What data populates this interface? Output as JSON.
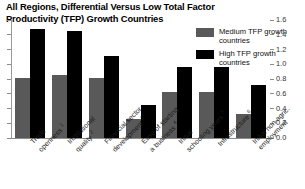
{
  "chart": {
    "title": "All Regions, Differential Versus Low Total Factor Productivity (TFP) Growth Countries"
  },
  "legend": {
    "position": "top-right",
    "items": [
      {
        "label": "Medium TFP growth countries",
        "color": "#595959",
        "name": "medium-tfp"
      },
      {
        "label": "High TFP growth countries",
        "color": "#000000",
        "name": "high-tfp"
      }
    ]
  },
  "axis": {
    "right_ticks": [
      "1.6",
      "1.4",
      "1.2",
      "1.0",
      "0.8",
      "0.6",
      "0.4",
      "0.2",
      "0.0"
    ],
    "values": [
      1.6,
      1.4,
      1.2,
      1.0,
      0.8,
      0.6,
      0.4,
      0.2,
      0.0
    ]
  },
  "categories": [
    {
      "line1": "Trade",
      "line2": "openness",
      "note": "1"
    },
    {
      "line1": "Institutional",
      "line2": "quality",
      "note": "2"
    },
    {
      "line1": "Financial sector",
      "line2": "development",
      "note": "3"
    },
    {
      "line1": "Ease of starting",
      "line2": "a business",
      "note": "4"
    },
    {
      "line1": "Initial",
      "line2": "schooling years",
      "note": "5"
    },
    {
      "line1": "Infrastructure",
      "line2": "",
      "note": "6"
    },
    {
      "line1": "Initial non-agric.",
      "line2": "employment",
      "note": ""
    }
  ],
  "chart_data": {
    "type": "bar",
    "title": "All Regions, Differential Versus Low Total Factor Productivity (TFP) Growth Countries",
    "xlabel": "",
    "ylabel": "",
    "ylim": [
      0.0,
      1.6
    ],
    "yaxis_position": "right",
    "grid": false,
    "categories": [
      "Trade openness 1",
      "Institutional quality 2",
      "Financial sector development 3",
      "Ease of starting a business 4",
      "Initial schooling years 5",
      "Infrastructure 6",
      "Initial non-agric. employment"
    ],
    "series": [
      {
        "name": "Medium TFP growth countries",
        "color": "#595959",
        "values": [
          0.81,
          0.85,
          0.81,
          0.26,
          0.63,
          0.63,
          0.33
        ]
      },
      {
        "name": "High TFP growth countries",
        "color": "#000000",
        "values": [
          1.48,
          1.45,
          1.11,
          0.45,
          0.96,
          0.96,
          0.72
        ]
      }
    ]
  }
}
